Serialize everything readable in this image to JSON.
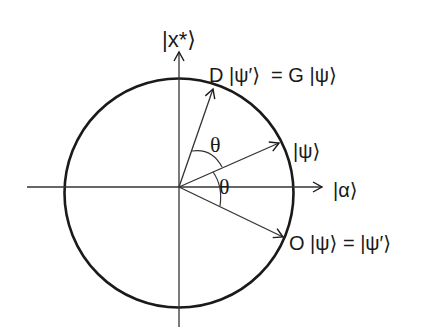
{
  "diagram": {
    "axes": {
      "vertical_label": "|x*⟩",
      "horizontal_label": "|α⟩"
    },
    "vectors": [
      {
        "name": "psi",
        "label": "|ψ⟩"
      },
      {
        "name": "d-psi-prime",
        "label": "D |ψ′⟩  = G |ψ⟩"
      },
      {
        "name": "o-psi",
        "label": "O |ψ⟩ = |ψ′⟩"
      }
    ],
    "angles": [
      {
        "name": "theta-upper",
        "label": "θ"
      },
      {
        "name": "theta-lower",
        "label": "θ"
      }
    ],
    "colors": {
      "stroke": "#1a1a1a",
      "background": "#ffffff"
    }
  }
}
